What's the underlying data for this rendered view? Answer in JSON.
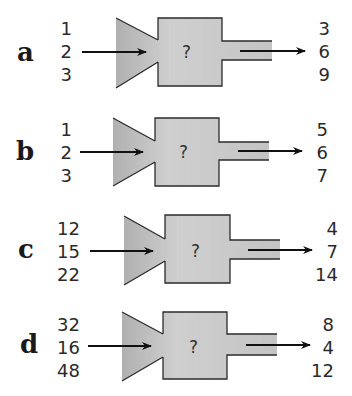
{
  "diagram": {
    "type": "function-machine-puzzle",
    "machine_label": "?",
    "colors": {
      "machine_fill_light": "#d9d9d9",
      "machine_fill_dark": "#b5b5b5",
      "outline": "#2b2b2b",
      "arrow": "#111111"
    },
    "panels": [
      {
        "label": "a",
        "inputs": [
          "1",
          "2",
          "3"
        ],
        "outputs": [
          "3",
          "6",
          "9"
        ]
      },
      {
        "label": "b",
        "inputs": [
          "1",
          "2",
          "3"
        ],
        "outputs": [
          "5",
          "6",
          "7"
        ]
      },
      {
        "label": "c",
        "inputs": [
          "12",
          "15",
          "22"
        ],
        "outputs": [
          "4",
          "7",
          "14"
        ]
      },
      {
        "label": "d",
        "inputs": [
          "32",
          "16",
          "48"
        ],
        "outputs": [
          "8",
          "4",
          "12"
        ]
      }
    ]
  }
}
